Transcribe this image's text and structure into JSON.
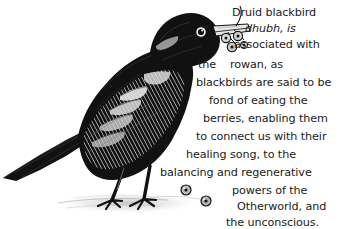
{
  "canvas": {
    "width": 339,
    "height": 229,
    "background_color": "#ffffff",
    "ink_color": "#111111"
  },
  "illustration": {
    "name": "blackbird-engraving",
    "description": "Black and white pen-and-ink engraving of a blackbird standing on the ground, facing right, holding a cluster of rowan berries in its beak, with a long tail pointing left and two fallen berries on the ground",
    "subject": "blackbird",
    "style": "woodcut-engraving",
    "elements": [
      "bird-body",
      "bird-head",
      "bird-beak",
      "berry-cluster-in-beak",
      "bird-tail",
      "bird-legs",
      "bird-feet",
      "ground-shadow",
      "fallen-berries"
    ]
  },
  "caption": {
    "full_text": "Druid blackbird dhubh, is associated with the rowan, as blackbirds are said to be fond of eating the berries, enabling them to connect us with their healing song, to the balancing and regenerative powers of the Otherworld, and the unconscious.",
    "lines": [
      {
        "text": "Druid blackbird",
        "style": "normal",
        "x": 232,
        "y": 6,
        "align": "left"
      },
      {
        "text": "dhubh, is",
        "style": "italic",
        "x": 245,
        "y": 22,
        "align": "left"
      },
      {
        "text": "associated with",
        "style": "normal",
        "x": 234,
        "y": 38,
        "align": "left"
      },
      {
        "text": "the    rowan, as",
        "style": "normal",
        "x": 198,
        "y": 58,
        "align": "left"
      },
      {
        "text": "blackbirds are said to be",
        "style": "normal",
        "x": 196,
        "y": 76,
        "align": "left"
      },
      {
        "text": "fond of eating the",
        "style": "normal",
        "x": 209,
        "y": 94,
        "align": "left"
      },
      {
        "text": "berries, enabling them",
        "style": "normal",
        "x": 203,
        "y": 112,
        "align": "left"
      },
      {
        "text": "to connect us with their",
        "style": "normal",
        "x": 196,
        "y": 130,
        "align": "left"
      },
      {
        "text": "healing song, to the",
        "style": "normal",
        "x": 186,
        "y": 148,
        "align": "left"
      },
      {
        "text": "balancing and regenerative",
        "style": "normal",
        "x": 160,
        "y": 166,
        "align": "left"
      },
      {
        "text": "powers of the",
        "style": "normal",
        "x": 232,
        "y": 184,
        "align": "left"
      },
      {
        "text": "Otherworld, and",
        "style": "normal",
        "x": 237,
        "y": 200,
        "align": "left"
      },
      {
        "text": "the unconscious.",
        "style": "normal",
        "x": 226,
        "y": 216,
        "align": "left"
      }
    ]
  }
}
